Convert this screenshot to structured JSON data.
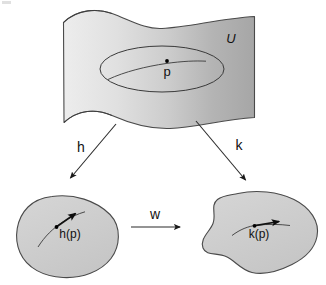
{
  "figure": {
    "domain_label": "U",
    "point_label": "p",
    "map_left_label": "h",
    "map_right_label": "k",
    "map_transition_label": "w",
    "image_left_label": "h(p)",
    "image_right_label": "k(p)",
    "colors": {
      "surface_light": "#e8e8e8",
      "surface_dark": "#a8a8a8",
      "blob_fill": "#cfcfcf",
      "outline": "#4a4a4a",
      "ink": "#111111",
      "background": "#ffffff"
    },
    "elements": {
      "surface_name": "wavy-manifold-surface",
      "ellipse_name": "coordinate-neighborhood-ellipse",
      "curve_name": "curve-through-p",
      "blob_left_name": "left-chart-domain-blob",
      "blob_right_name": "right-chart-domain-blob"
    }
  }
}
